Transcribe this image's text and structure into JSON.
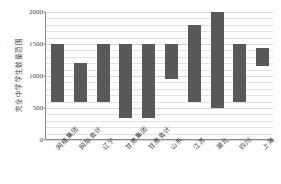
{
  "chart_data": {
    "type": "bar",
    "subtype": "floating-range-bar",
    "title": "",
    "xlabel": "",
    "ylabel": "完全中学学生数量范围",
    "ylim": [
      0,
      2000
    ],
    "yticks": [
      0,
      500,
      1000,
      1500,
      2000
    ],
    "ytick_labels": [
      "0",
      "500",
      "1000",
      "1500",
      "2000"
    ],
    "gridlines": [
      0,
      100,
      200,
      300,
      400,
      500,
      600,
      700,
      800,
      900,
      1000,
      1100,
      1200,
      1300,
      1400,
      1500,
      1600,
      1700,
      1800,
      1900,
      2000
    ],
    "grid": true,
    "legend": "none",
    "bar_color": "#595959",
    "categories": [
      "网络集团",
      "网际会计",
      "辽宁",
      "甘肃集团",
      "甘肃会计",
      "山东",
      "江苏",
      "湖北",
      "四川",
      "上海"
    ],
    "series": [
      {
        "name": "学生数量范围",
        "low": [
          600,
          600,
          600,
          350,
          350,
          950,
          600,
          500,
          600,
          1150
        ],
        "high": [
          1500,
          1200,
          1500,
          1500,
          1500,
          1500,
          1800,
          2000,
          1500,
          1430
        ]
      }
    ]
  },
  "axis": {
    "y_title": "完全中学学生数量范围"
  }
}
